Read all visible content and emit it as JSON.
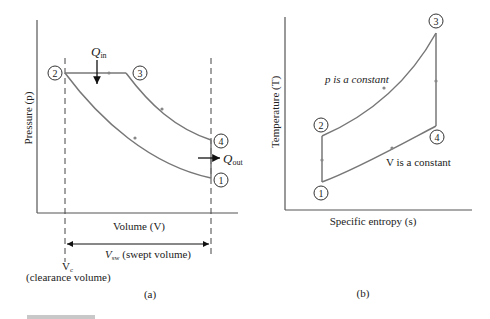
{
  "figure_a": {
    "caption": "(a)",
    "y_axis_label": "Pressure (p)",
    "x_axis_label": "Volume (V)",
    "heat_in_label": "Q",
    "heat_in_sub": "in",
    "heat_out_label": "Q",
    "heat_out_sub": "out",
    "swept_volume_label_main": "V",
    "swept_volume_label_sub": "sw",
    "swept_volume_label_rest": " (swept volume)",
    "clearance_label_main": "V",
    "clearance_label_sub": "c",
    "clearance_label_rest": "(clearance volume)",
    "states": [
      "1",
      "2",
      "3",
      "4"
    ]
  },
  "figure_b": {
    "caption": "(b)",
    "y_axis_label": "Temperature (T)",
    "x_axis_label": "Specific entropy (s)",
    "upper_curve_label": "p is a constant",
    "lower_curve_label": "V is a constant",
    "states": [
      "1",
      "2",
      "3",
      "4"
    ]
  },
  "colors": {
    "curve": "#777777",
    "axis": "#555555",
    "text": "#222222",
    "footer_bar": "#c8c8c8"
  }
}
